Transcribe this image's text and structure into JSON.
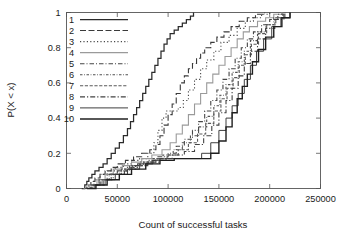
{
  "chart_data": {
    "type": "line",
    "subtype": "empirical-cdf-step",
    "title": "",
    "subtitle": "",
    "xlabel": "Count of successful tasks",
    "ylabel": "P(X < x)",
    "xlim": [
      0,
      250000
    ],
    "ylim": [
      0,
      1
    ],
    "grid": false,
    "legend_position": "top-left inside",
    "xticks": [
      0,
      50000,
      100000,
      150000,
      200000,
      250000
    ],
    "xticklabels": [
      "0",
      "50000",
      "100000",
      "150000",
      "200000",
      "250000"
    ],
    "yticks": [
      0,
      0.2,
      0.4,
      0.6,
      0.8,
      1
    ],
    "yticklabels": [
      "0",
      "0.2",
      "0.4",
      "0.6",
      "0.8",
      "1"
    ],
    "legend_entries": [
      "1",
      "2",
      "3",
      "4",
      "5",
      "6",
      "7",
      "8",
      "9",
      "10"
    ],
    "series": [
      {
        "name": "1",
        "dash": "none",
        "color": "#2b2b2b",
        "width": 1.25,
        "x": [
          15000,
          18000,
          20000,
          22000,
          25000,
          28000,
          32000,
          36000,
          40000,
          44000,
          48000,
          52000,
          56000,
          60000,
          63000,
          66000,
          69000,
          72000,
          75000,
          78000,
          81000,
          84000,
          87000,
          90000,
          93000,
          96000,
          99000,
          102000,
          106000,
          110000,
          114000,
          118000,
          122000,
          125000
        ],
        "y": [
          0.0,
          0.02,
          0.04,
          0.06,
          0.08,
          0.1,
          0.12,
          0.14,
          0.17,
          0.2,
          0.23,
          0.26,
          0.3,
          0.34,
          0.38,
          0.42,
          0.46,
          0.5,
          0.54,
          0.58,
          0.62,
          0.66,
          0.7,
          0.74,
          0.78,
          0.82,
          0.85,
          0.88,
          0.9,
          0.92,
          0.94,
          0.96,
          0.98,
          1.0
        ]
      },
      {
        "name": "2",
        "dash": "6,2.5",
        "color": "#3a3a3a",
        "width": 1.1,
        "x": [
          16000,
          20000,
          24000,
          28000,
          33000,
          38000,
          44000,
          50000,
          58000,
          66000,
          74000,
          82000,
          88000,
          92000,
          96000,
          100000,
          104000,
          108000,
          112000,
          116000,
          120000,
          124000,
          128000,
          132000,
          136000,
          142000,
          148000,
          155000,
          162000,
          170000,
          178000,
          186000,
          195000
        ],
        "y": [
          0.0,
          0.02,
          0.04,
          0.06,
          0.08,
          0.1,
          0.12,
          0.14,
          0.16,
          0.18,
          0.2,
          0.22,
          0.25,
          0.3,
          0.36,
          0.42,
          0.48,
          0.54,
          0.6,
          0.64,
          0.68,
          0.71,
          0.74,
          0.77,
          0.8,
          0.83,
          0.86,
          0.89,
          0.92,
          0.95,
          0.97,
          0.99,
          1.0
        ]
      },
      {
        "name": "3",
        "dash": "1.2,2.2",
        "color": "#4a4a4a",
        "width": 1.1,
        "x": [
          17000,
          22000,
          27000,
          33000,
          40000,
          48000,
          56000,
          64000,
          72000,
          80000,
          86000,
          90000,
          94000,
          98000,
          102000,
          106000,
          110000,
          115000,
          120000,
          126000,
          132000,
          138000,
          145000,
          152000,
          160000,
          168000,
          176000,
          184000,
          192000,
          200000
        ],
        "y": [
          0.0,
          0.02,
          0.05,
          0.08,
          0.1,
          0.12,
          0.14,
          0.16,
          0.17,
          0.2,
          0.26,
          0.33,
          0.4,
          0.44,
          0.44,
          0.44,
          0.46,
          0.5,
          0.56,
          0.62,
          0.68,
          0.73,
          0.78,
          0.83,
          0.87,
          0.91,
          0.95,
          0.97,
          0.99,
          1.0
        ]
      },
      {
        "name": "4",
        "dash": "none",
        "color": "#9a9a9a",
        "width": 1.1,
        "x": [
          17000,
          23000,
          30000,
          38000,
          46000,
          55000,
          64000,
          74000,
          84000,
          94000,
          102000,
          108000,
          114000,
          120000,
          126000,
          132000,
          138000,
          144000,
          150000,
          156000,
          162000,
          168000,
          174000,
          180000,
          188000,
          196000,
          204000,
          212000
        ],
        "y": [
          0.0,
          0.02,
          0.05,
          0.08,
          0.11,
          0.13,
          0.15,
          0.17,
          0.19,
          0.22,
          0.26,
          0.31,
          0.36,
          0.42,
          0.48,
          0.54,
          0.6,
          0.65,
          0.7,
          0.75,
          0.8,
          0.85,
          0.89,
          0.92,
          0.95,
          0.97,
          0.99,
          1.0
        ]
      },
      {
        "name": "5",
        "dash": "4.5,2,1,2",
        "color": "#464646",
        "width": 1.1,
        "x": [
          18000,
          24000,
          32000,
          40000,
          50000,
          60000,
          70000,
          80000,
          90000,
          100000,
          108000,
          116000,
          124000,
          130000,
          136000,
          142000,
          148000,
          154000,
          160000,
          166000,
          172000,
          178000,
          184000,
          192000,
          200000,
          208000,
          216000
        ],
        "y": [
          0.0,
          0.02,
          0.05,
          0.08,
          0.1,
          0.12,
          0.14,
          0.16,
          0.18,
          0.2,
          0.24,
          0.28,
          0.33,
          0.38,
          0.44,
          0.5,
          0.56,
          0.62,
          0.68,
          0.74,
          0.8,
          0.85,
          0.89,
          0.93,
          0.96,
          0.99,
          1.0
        ]
      },
      {
        "name": "6",
        "dash": "2.5,1.6,0.8,1.6",
        "color": "#505050",
        "width": 1.1,
        "x": [
          18000,
          25000,
          33000,
          42000,
          52000,
          62000,
          73000,
          84000,
          95000,
          105000,
          114000,
          122000,
          130000,
          138000,
          145000,
          151000,
          157000,
          163000,
          169000,
          175000,
          181000,
          188000,
          196000,
          204000,
          213000
        ],
        "y": [
          0.0,
          0.02,
          0.05,
          0.08,
          0.1,
          0.13,
          0.15,
          0.17,
          0.19,
          0.22,
          0.26,
          0.3,
          0.35,
          0.41,
          0.47,
          0.53,
          0.59,
          0.66,
          0.72,
          0.78,
          0.84,
          0.89,
          0.93,
          0.97,
          1.0
        ]
      },
      {
        "name": "7",
        "dash": "3.2,1.6,3.2,1.6",
        "color": "#5a5a5a",
        "width": 1.1,
        "x": [
          19000,
          26000,
          34000,
          44000,
          54000,
          65000,
          76000,
          88000,
          99000,
          110000,
          120000,
          129000,
          137000,
          145000,
          152000,
          158000,
          164000,
          170000,
          176000,
          182000,
          189000,
          197000,
          206000,
          215000
        ],
        "y": [
          0.0,
          0.02,
          0.05,
          0.08,
          0.11,
          0.13,
          0.15,
          0.17,
          0.19,
          0.22,
          0.26,
          0.31,
          0.37,
          0.44,
          0.51,
          0.57,
          0.63,
          0.7,
          0.76,
          0.82,
          0.88,
          0.93,
          0.97,
          1.0
        ]
      },
      {
        "name": "8",
        "dash": "5,2,1.2,2",
        "color": "#424242",
        "width": 1.1,
        "x": [
          19000,
          27000,
          36000,
          46000,
          57000,
          68000,
          80000,
          92000,
          104000,
          116000,
          126000,
          135000,
          143000,
          150000,
          157000,
          163000,
          169000,
          175000,
          181000,
          188000,
          196000,
          205000,
          214000
        ],
        "y": [
          0.0,
          0.02,
          0.05,
          0.08,
          0.11,
          0.13,
          0.15,
          0.17,
          0.19,
          0.21,
          0.25,
          0.3,
          0.36,
          0.43,
          0.5,
          0.57,
          0.64,
          0.71,
          0.78,
          0.85,
          0.91,
          0.96,
          1.0
        ]
      },
      {
        "name": "9",
        "dash": "none",
        "color": "#3f3f3f",
        "width": 1.0,
        "x": [
          20000,
          28000,
          38000,
          48000,
          60000,
          72000,
          85000,
          98000,
          110000,
          122000,
          133000,
          142000,
          150000,
          157000,
          163000,
          169000,
          175000,
          181000,
          187000,
          194000,
          202000,
          211000,
          220000
        ],
        "y": [
          0.0,
          0.02,
          0.05,
          0.08,
          0.11,
          0.14,
          0.16,
          0.17,
          0.17,
          0.17,
          0.2,
          0.26,
          0.33,
          0.4,
          0.47,
          0.54,
          0.62,
          0.7,
          0.78,
          0.85,
          0.92,
          0.97,
          1.0
        ]
      },
      {
        "name": "10",
        "dash": "none",
        "color": "#1f1f1f",
        "width": 1.4,
        "x": [
          20000,
          29000,
          40000,
          52000,
          64000,
          78000,
          92000,
          106000,
          120000,
          132000,
          142000,
          150000,
          157000,
          163000,
          168000,
          173000,
          178000,
          183000,
          189000,
          196000,
          204000,
          212000,
          220000
        ],
        "y": [
          0.0,
          0.02,
          0.05,
          0.08,
          0.11,
          0.14,
          0.16,
          0.17,
          0.17,
          0.17,
          0.2,
          0.27,
          0.35,
          0.43,
          0.51,
          0.58,
          0.65,
          0.72,
          0.79,
          0.86,
          0.92,
          0.97,
          1.0
        ]
      }
    ]
  }
}
